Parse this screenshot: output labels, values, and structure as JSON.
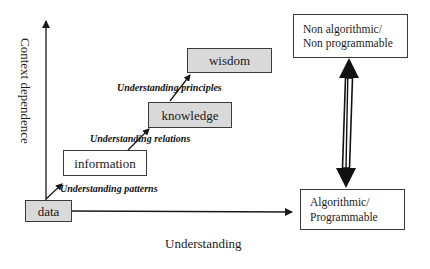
{
  "diagram": {
    "axes": {
      "y_label": "Context dependence",
      "x_label": "Understanding"
    },
    "hierarchy": [
      {
        "id": "data",
        "label": "data",
        "fill": "#d9d9d9"
      },
      {
        "id": "information",
        "label": "information",
        "fill": "#ffffff"
      },
      {
        "id": "knowledge",
        "label": "knowledge",
        "fill": "#d9d9d9"
      },
      {
        "id": "wisdom",
        "label": "wisdom",
        "fill": "#d9d9d9"
      }
    ],
    "transitions": [
      {
        "from": "data",
        "to": "information",
        "label": "Understanding patterns"
      },
      {
        "from": "information",
        "to": "knowledge",
        "label": "Understanding relations"
      },
      {
        "from": "knowledge",
        "to": "wisdom",
        "label": "Understanding principles"
      }
    ],
    "right_scale": {
      "top": {
        "line1": "Non algorithmic/",
        "line2": "Non programmable"
      },
      "bottom": {
        "line1": "Algorithmic/",
        "line2": "Programmable"
      },
      "connector": "double-headed arrow"
    }
  }
}
